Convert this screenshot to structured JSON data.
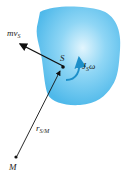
{
  "diagram": {
    "title": "",
    "body": {
      "fill_center": "#d6f0fc",
      "fill_edge": "#5ec2ee"
    },
    "labels": {
      "momentum": {
        "main": "mv",
        "sub": "S"
      },
      "point_s": "S",
      "angular": {
        "main": "J",
        "sub": "S",
        "tail": "ω"
      },
      "position": {
        "main": "r",
        "sub": "S/M"
      },
      "point_m": "M"
    },
    "colors": {
      "arrow": "#111111",
      "curl_arrow": "#1d8fc9"
    }
  }
}
